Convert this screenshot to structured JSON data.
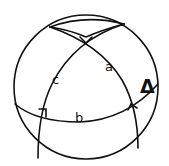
{
  "diagram": {
    "type": "spherical-triangle",
    "labels": {
      "side_a": "a",
      "side_b": "b",
      "side_c": "c",
      "triangle_symbol": "Δ"
    },
    "right_angle_markers": 3,
    "colors": {
      "line": "#111111",
      "background": "#ffffff"
    }
  }
}
